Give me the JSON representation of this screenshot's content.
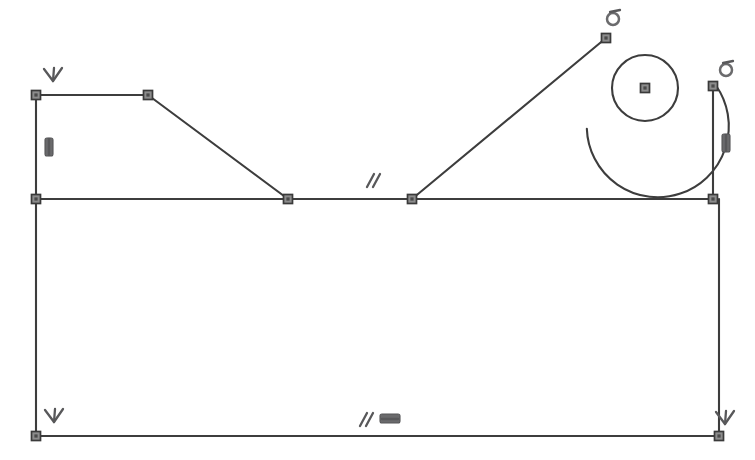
{
  "canvas": {
    "width": 755,
    "height": 460,
    "background": "#ffffff",
    "geometry_color": "#3d3d3d",
    "node_color": "#8c8c8c",
    "constraint_color": "#58585a"
  },
  "sketch": {
    "title": "",
    "geometry": {
      "lines": [
        {
          "name": "top-left-horizontal-line",
          "x1": 36,
          "y1": 95,
          "x2": 148,
          "y2": 95
        },
        {
          "name": "upper-left-diagonal-line",
          "x1": 148,
          "y1": 95,
          "x2": 288,
          "y2": 199
        },
        {
          "name": "left-vertical-upper-line",
          "x1": 36,
          "y1": 95,
          "x2": 36,
          "y2": 199
        },
        {
          "name": "left-vertical-lower-line",
          "x1": 36,
          "y1": 199,
          "x2": 36,
          "y2": 436
        },
        {
          "name": "middle-horizontal-left-line",
          "x1": 36,
          "y1": 199,
          "x2": 288,
          "y2": 199
        },
        {
          "name": "middle-horizontal-center-line",
          "x1": 288,
          "y1": 199,
          "x2": 412,
          "y2": 199
        },
        {
          "name": "middle-horizontal-right-line",
          "x1": 412,
          "y1": 199,
          "x2": 713,
          "y2": 199
        },
        {
          "name": "upper-right-diagonal-line",
          "x1": 412,
          "y1": 199,
          "x2": 606,
          "y2": 38
        },
        {
          "name": "right-vertical-line",
          "x1": 713,
          "y1": 86,
          "x2": 713,
          "y2": 199
        },
        {
          "name": "bottom-horizontal-line",
          "x1": 36,
          "y1": 436,
          "x2": 719,
          "y2": 436
        },
        {
          "name": "right-vertical-lower-line",
          "x1": 719,
          "y1": 199,
          "x2": 719,
          "y2": 436
        }
      ],
      "arcs": [
        {
          "name": "top-right-fillet-arc",
          "cx": 645,
          "cy": 88,
          "r": 71,
          "start_deg": 215,
          "end_deg": 2
        }
      ],
      "circles": [
        {
          "name": "center-circle",
          "cx": 645,
          "cy": 88,
          "r": 33
        }
      ]
    },
    "nodes": [
      {
        "name": "node-top-left",
        "x": 36,
        "y": 95
      },
      {
        "name": "node-top-bend",
        "x": 148,
        "y": 95
      },
      {
        "name": "node-left-mid",
        "x": 36,
        "y": 199
      },
      {
        "name": "node-mid-left-junction",
        "x": 288,
        "y": 199
      },
      {
        "name": "node-mid-right-junction",
        "x": 412,
        "y": 199
      },
      {
        "name": "node-arc-start",
        "x": 606,
        "y": 38
      },
      {
        "name": "node-arc-end",
        "x": 713,
        "y": 86
      },
      {
        "name": "node-right-mid",
        "x": 713,
        "y": 199
      },
      {
        "name": "node-bottom-left",
        "x": 36,
        "y": 436
      },
      {
        "name": "node-bottom-right",
        "x": 719,
        "y": 436
      },
      {
        "name": "node-circle-center",
        "x": 645,
        "y": 88
      }
    ],
    "constraints": [
      {
        "name": "constraint-perpendicular-top-left",
        "type": "perpendicular",
        "x": 53,
        "y": 76,
        "rotation": 0
      },
      {
        "name": "constraint-vertical-left",
        "type": "vertical",
        "x": 49,
        "y": 147,
        "rotation": 0
      },
      {
        "name": "constraint-parallel-middle",
        "type": "parallel",
        "x": 373,
        "y": 181,
        "rotation": 0
      },
      {
        "name": "constraint-tangent-arc-start",
        "type": "tangent",
        "x": 613,
        "y": 18,
        "rotation": 0
      },
      {
        "name": "constraint-tangent-arc-end",
        "type": "tangent",
        "x": 726,
        "y": 69,
        "rotation": 0
      },
      {
        "name": "constraint-vertical-right",
        "type": "vertical",
        "x": 726,
        "y": 143,
        "rotation": 0
      },
      {
        "name": "constraint-parallel-bottom",
        "type": "parallel",
        "x": 366,
        "y": 420,
        "rotation": 0
      },
      {
        "name": "constraint-horizontal-bottom",
        "type": "horizontal",
        "x": 390,
        "y": 419,
        "rotation": 0
      },
      {
        "name": "constraint-perpendicular-bottom-left",
        "type": "perpendicular",
        "x": 54,
        "y": 417,
        "rotation": 0
      },
      {
        "name": "constraint-perpendicular-bottom-right",
        "type": "perpendicular",
        "x": 725,
        "y": 419,
        "rotation": 0
      }
    ],
    "legend": {
      "perpendicular_label": "Perpendicular",
      "vertical_label": "Vertical",
      "horizontal_label": "Horizontal",
      "parallel_label": "Parallel",
      "tangent_label": "Tangent"
    }
  }
}
